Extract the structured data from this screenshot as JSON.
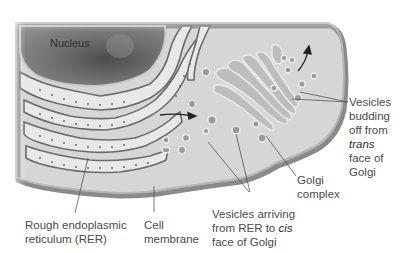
{
  "diagram": {
    "type": "cell-secretory-pathway-illustration",
    "colors": {
      "background": "#ffffff",
      "cytoplasm": "#d4d4d4",
      "membrane": "#8c8c8c",
      "nucleus": "#6e6e6e",
      "er_lumen": "#e6e6e6",
      "leader_line": "#555555",
      "label_text": "#4a4a4a"
    },
    "labels": {
      "nucleus": "Nucleus",
      "rer": {
        "line1": "Rough endoplasmic",
        "line2": "reticulum (RER)"
      },
      "cell_membrane": {
        "line1": "Cell",
        "line2": "membrane"
      },
      "vesicles_arriving": {
        "line1": "Vesicles arriving",
        "line2_prefix": "from RER to ",
        "line2_italic": "cis",
        "line3": "face of Golgi"
      },
      "golgi": {
        "line1": "Golgi",
        "line2": "complex"
      },
      "vesicles_budding": {
        "line1": "Vesicles",
        "line2": "budding",
        "line3": "off from",
        "line4_italic": "trans",
        "line5": "face of",
        "line6": "Golgi"
      }
    }
  }
}
